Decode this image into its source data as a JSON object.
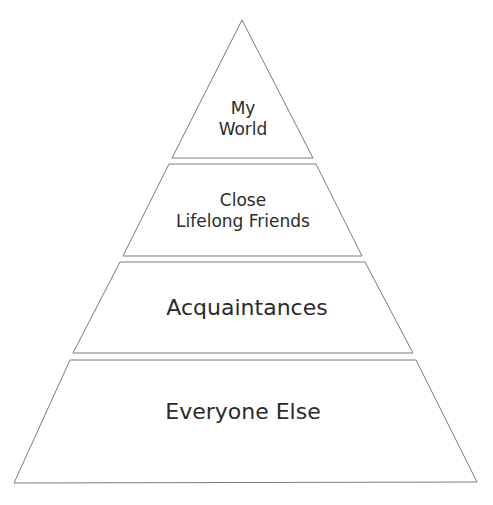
{
  "diagram": {
    "type": "pyramid",
    "levels": [
      {
        "lines": [
          "My",
          "World"
        ],
        "label": "My World"
      },
      {
        "lines": [
          "Close",
          "Lifelong Friends"
        ],
        "label": "Close Lifelong Friends"
      },
      {
        "lines": [
          "Acquaintances"
        ],
        "label": "Acquaintances"
      },
      {
        "lines": [
          "Everyone Else"
        ],
        "label": "Everyone Else"
      }
    ],
    "colors": {
      "fill": "#ffffff",
      "stroke": "#7a7a7a",
      "text": "#2b2b2b"
    }
  }
}
